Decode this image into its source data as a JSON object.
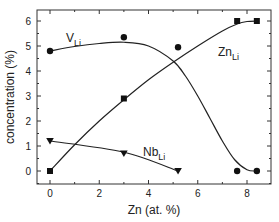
{
  "chart_data": {
    "type": "line",
    "title": "",
    "xlabel": "Zn (at. %)",
    "ylabel": "concentration (%)",
    "xlim": [
      -0.6,
      9.3
    ],
    "ylim": [
      -0.5,
      6.5
    ],
    "xticks": [
      0,
      2,
      4,
      6,
      8
    ],
    "yticks": [
      0,
      1,
      2,
      3,
      4,
      5,
      6
    ],
    "grid": false,
    "legend": "inline labels",
    "series": [
      {
        "name": "V_Li",
        "label_main": "V",
        "label_sub": "Li",
        "marker": "circle",
        "x": [
          0,
          3,
          5.2,
          7.6,
          8.4
        ],
        "y": [
          4.8,
          5.35,
          4.95,
          0,
          0
        ],
        "curve": [
          [
            0,
            4.8
          ],
          [
            1,
            4.98
          ],
          [
            2,
            5.1
          ],
          [
            3,
            5.15
          ],
          [
            4,
            5.0
          ],
          [
            5,
            4.4
          ],
          [
            5.5,
            3.8
          ],
          [
            6,
            3.0
          ],
          [
            6.5,
            2.1
          ],
          [
            7,
            1.2
          ],
          [
            7.5,
            0.45
          ],
          [
            8,
            0.05
          ],
          [
            8.4,
            0
          ]
        ]
      },
      {
        "name": "Zn_Li",
        "label_main": "Zn",
        "label_sub": "Li",
        "marker": "square",
        "x": [
          0,
          3,
          7.6,
          8.4
        ],
        "y": [
          0,
          2.9,
          6.0,
          6.0
        ],
        "curve": [
          [
            0,
            0
          ],
          [
            1,
            1.05
          ],
          [
            2,
            2.0
          ],
          [
            3,
            2.85
          ],
          [
            4,
            3.65
          ],
          [
            5,
            4.35
          ],
          [
            6,
            5.0
          ],
          [
            7,
            5.6
          ],
          [
            7.6,
            5.88
          ],
          [
            8,
            5.98
          ],
          [
            8.4,
            6.0
          ]
        ]
      },
      {
        "name": "Nb_Li",
        "label_main": "Nb",
        "label_sub": "Li",
        "marker": "triangle-down",
        "x": [
          0,
          3,
          5.2
        ],
        "y": [
          1.2,
          0.7,
          0
        ],
        "curve": [
          [
            0,
            1.2
          ],
          [
            3,
            0.75
          ],
          [
            5.2,
            0
          ]
        ]
      }
    ]
  }
}
